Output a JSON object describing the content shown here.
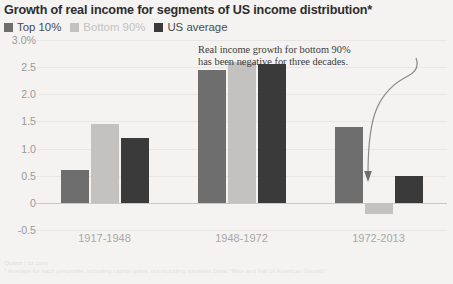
{
  "title": "Growth of real income for segments of US income distribution*",
  "legend": {
    "items": [
      {
        "label": "Top 10%",
        "color": "#6e6e6e"
      },
      {
        "label": "Bottom 90%",
        "color": "#c3c2c0"
      },
      {
        "label": "US average",
        "color": "#3a3a3a"
      }
    ]
  },
  "annotation": {
    "line1": "Real income growth for bottom 90%",
    "line2": "has been negative for three decades."
  },
  "footer": {
    "credit": "Quartz | qz.com",
    "footnote": "* Average for each percentile, including capital gains, not including transfers Data: \"Rise and Fall of American Growth\""
  },
  "chart_data": {
    "type": "bar",
    "title": "Growth of real income for segments of US income distribution*",
    "xlabel": "",
    "ylabel": "",
    "ylim": [
      -0.5,
      3.0
    ],
    "grid": true,
    "legend_position": "top-left",
    "categories": [
      "1917-1948",
      "1948-1972",
      "1972-2013"
    ],
    "ytick_labels": [
      "3.0%",
      "2.5",
      "2.0",
      "1.5",
      "1.0",
      "0.5",
      "0",
      "-0.5"
    ],
    "ytick_values": [
      3.0,
      2.5,
      2.0,
      1.5,
      1.0,
      0.5,
      0,
      -0.5
    ],
    "series": [
      {
        "name": "Top 10%",
        "color": "#6e6e6e",
        "values": [
          0.6,
          2.45,
          1.4
        ]
      },
      {
        "name": "Bottom 90%",
        "color": "#c3c2c0",
        "values": [
          1.45,
          2.6,
          -0.2
        ]
      },
      {
        "name": "US average",
        "color": "#3a3a3a",
        "values": [
          1.2,
          2.55,
          0.5
        ]
      }
    ]
  }
}
